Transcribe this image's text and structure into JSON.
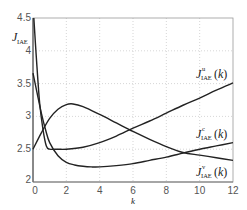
{
  "chart_data": {
    "type": "line",
    "title": "",
    "xlabel": "k",
    "ylabel": "J_IAE",
    "ylabel_main": "J",
    "ylabel_sub": "IAE",
    "xlim": [
      0,
      12
    ],
    "ylim": [
      2,
      4.5
    ],
    "xticks": [
      0,
      2,
      4,
      6,
      8,
      10,
      12
    ],
    "yticks": [
      2,
      2.5,
      3,
      3.5,
      4,
      4.5
    ],
    "ytick_labels": [
      "2",
      "2.5",
      "3",
      "3.5",
      "4",
      "4.5"
    ],
    "xtick_labels": [
      "0",
      "2",
      "4",
      "6",
      "8",
      "10",
      "12"
    ],
    "grid": true,
    "legend_position": "inline labels at right",
    "series": [
      {
        "name": "J^u_IAE(k)",
        "label_main": "J",
        "label_sup": "u",
        "label_sub": "IAE",
        "label_arg": "(k)",
        "color": "#222222",
        "x": [
          0.05,
          0.2,
          0.4,
          0.6,
          0.8,
          1.0,
          1.5,
          2.0,
          3.0,
          4.0,
          5.0,
          6.0,
          7.0,
          8.0,
          9.0,
          10.0,
          11.0,
          12.0
        ],
        "y": [
          4.5,
          3.9,
          3.2,
          2.8,
          2.55,
          2.5,
          2.5,
          2.5,
          2.53,
          2.6,
          2.7,
          2.82,
          2.93,
          3.05,
          3.17,
          3.28,
          3.4,
          3.51
        ]
      },
      {
        "name": "J^c_IAE(k)",
        "label_main": "J",
        "label_sup": "c",
        "label_sub": "IAE",
        "label_arg": "(k)",
        "color": "#222222",
        "x": [
          0,
          0.25,
          0.5,
          0.75,
          1.0,
          1.5,
          2.0,
          2.5,
          3.0,
          3.5,
          4.0,
          5.0,
          6.0,
          7.0,
          8.0,
          9.0,
          10.0,
          11.0,
          12.0
        ],
        "y": [
          3.66,
          3.35,
          3.05,
          2.8,
          2.6,
          2.4,
          2.3,
          2.26,
          2.24,
          2.23,
          2.23,
          2.25,
          2.28,
          2.33,
          2.38,
          2.44,
          2.5,
          2.55,
          2.6
        ]
      },
      {
        "name": "J^v_IAE(k)",
        "label_main": "J",
        "label_sup": "v",
        "label_sub": "IAE",
        "label_arg": "(k)",
        "color": "#222222",
        "x": [
          0,
          0.5,
          1.0,
          1.5,
          2.0,
          2.4,
          3.0,
          4.0,
          5.0,
          6.0,
          7.0,
          8.0,
          9.0,
          10.0,
          11.0,
          12.0
        ],
        "y": [
          2.5,
          2.75,
          2.97,
          3.11,
          3.18,
          3.19,
          3.15,
          3.03,
          2.9,
          2.77,
          2.65,
          2.54,
          2.45,
          2.41,
          2.37,
          2.33
        ]
      }
    ]
  }
}
